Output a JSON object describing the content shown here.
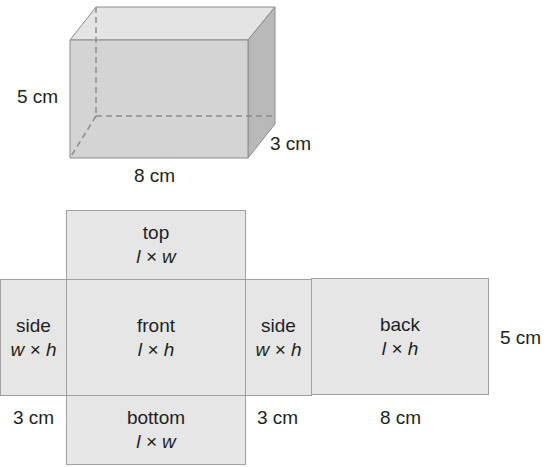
{
  "prism": {
    "height_label": "5 cm",
    "length_label": "8 cm",
    "width_label": "3 cm",
    "colors": {
      "front": "#d4d4d4",
      "top": "#e4e4e4",
      "side": "#b9b9b9",
      "edge": "#8c8c8c",
      "hidden_edge": "#8c8c8c"
    }
  },
  "net": {
    "faces": [
      {
        "id": "top",
        "name": "top",
        "formula": "l × w"
      },
      {
        "id": "side-left",
        "name": "side",
        "formula": "w × h"
      },
      {
        "id": "front",
        "name": "front",
        "formula": "l × h"
      },
      {
        "id": "side-right",
        "name": "side",
        "formula": "w × h"
      },
      {
        "id": "back",
        "name": "back",
        "formula": "l × h"
      },
      {
        "id": "bottom",
        "name": "bottom",
        "formula": "l × w"
      }
    ],
    "dimension_labels": {
      "left_side_width": "3 cm",
      "right_side_width": "3 cm",
      "back_length": "8 cm",
      "height": "5 cm"
    },
    "colors": {
      "face_fill": "#e6e6e6",
      "face_border": "#a0a0a0"
    }
  }
}
